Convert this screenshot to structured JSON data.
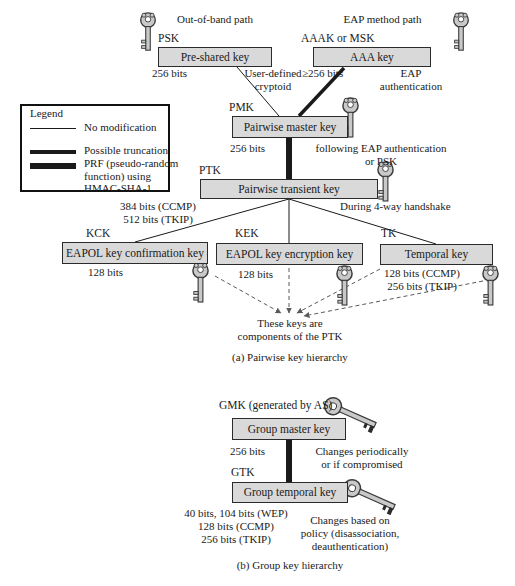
{
  "colors": {
    "background": "#ffffff",
    "box_fill": "#d9d9d9",
    "box_border": "#2b2b2b",
    "line": "#1a1a1a",
    "dashed_line": "#5a5a5a",
    "key_fill": "#c9c9c9",
    "text": "#1a1a1a"
  },
  "legend": {
    "title": "Legend",
    "items": [
      {
        "style": "thin",
        "label": "No modification"
      },
      {
        "style": "medium",
        "label": "Possible truncation"
      },
      {
        "style": "thick",
        "label": "PRF (pseudo-random\nfunction) using\nHMAC-SHA-1"
      }
    ]
  },
  "pairwise": {
    "caption": "(a) Pairwise key hierarchy",
    "out_of_band_path": "Out-of-band path",
    "eap_method_path": "EAP method path",
    "user_defined_note": "User-defined\ncryptoid",
    "eap_auth_note": "EAP\nauthentication",
    "following_note": "following EAP authentication\nor PSK",
    "handshake_note": "During 4-way handshake",
    "components_note": "These keys are\ncomponents of the PTK",
    "psk": {
      "tag": "PSK",
      "label": "Pre-shared key",
      "bits": "256 bits"
    },
    "aaa": {
      "tag": "AAAK or MSK",
      "label": "AAA key",
      "bits": "≥256 bits"
    },
    "pmk": {
      "tag": "PMK",
      "label": "Pairwise master key",
      "bits": "256 bits"
    },
    "ptk": {
      "tag": "PTK",
      "label": "Pairwise transient key",
      "bits": "384 bits (CCMP)\n512 bits (TKIP)"
    },
    "kck": {
      "tag": "KCK",
      "label": "EAPOL key confirmation key",
      "bits": "128 bits"
    },
    "kek": {
      "tag": "KEK",
      "label": "EAPOL key encryption key",
      "bits": "128 bits"
    },
    "tk": {
      "tag": "TK",
      "label": "Temporal key",
      "bits": "128 bits (CCMP)\n256 bits (TKIP)"
    }
  },
  "group": {
    "caption": "(b) Group key hierarchy",
    "gmk": {
      "tag": "GMK (generated by AS)",
      "label": "Group master key",
      "bits": "256 bits",
      "note": "Changes periodically\nor if compromised"
    },
    "gtk": {
      "tag": "GTK",
      "label": "Group temporal key",
      "bits": "40 bits, 104 bits (WEP)\n128 bits (CCMP)\n256 bits (TKIP)",
      "note": "Changes based on\npolicy (disassociation,\ndeauthentication)"
    }
  }
}
